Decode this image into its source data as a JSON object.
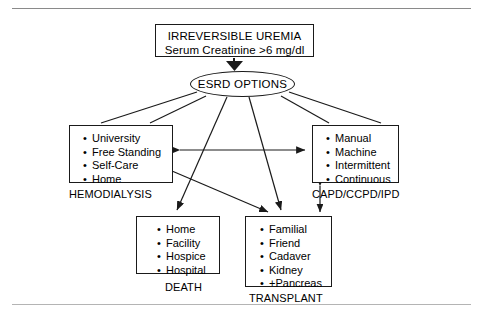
{
  "figure": {
    "top_node": {
      "line1": "IRREVERSIBLE UREMIA",
      "line2": "Serum Creatinine >6 mg/dl"
    },
    "decision_node": {
      "label": "ESRD OPTIONS"
    },
    "nodes": [
      {
        "id": "hemodialysis",
        "caption": "HEMODIALYSIS",
        "items": [
          "University",
          "Free Standing",
          "Self-Care",
          "Home"
        ]
      },
      {
        "id": "capd",
        "caption": "CAPD/CCPD/IPD",
        "items": [
          "Manual",
          "Machine",
          "Intermittent",
          "Continuous"
        ]
      },
      {
        "id": "death",
        "caption": "DEATH",
        "items": [
          "Home",
          "Facility",
          "Hospice",
          "Hospital"
        ]
      },
      {
        "id": "transplant",
        "caption": "TRANSPLANT",
        "items": [
          "Familial",
          "Friend",
          "Cadaver",
          "Kidney",
          "+Pancreas"
        ]
      }
    ],
    "bullet_glyph": "•",
    "colors": {
      "stroke": "#1a1a1a",
      "background": "#ffffff",
      "rule": "#8a8a8a"
    }
  }
}
